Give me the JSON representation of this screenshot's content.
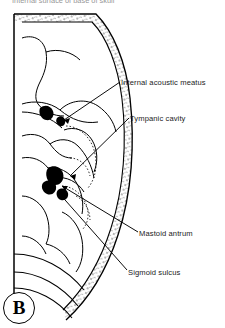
{
  "figure": {
    "panel_label": "B",
    "cut_off_heading": "Internal surface of base of skull",
    "background_color": "#ffffff",
    "ink_color": "#000000",
    "text_color": "#1b1b1b"
  },
  "labels": [
    {
      "id": "internal-acoustic-meatus",
      "text": "Internal acoustic meatus"
    },
    {
      "id": "tympanic-cavity",
      "text": "Tympanic cavity"
    },
    {
      "id": "mastoid-antrum",
      "text": "Mastoid antrum"
    },
    {
      "id": "sigmoid-sulcus",
      "text": "Sigmoid sulcus"
    }
  ]
}
